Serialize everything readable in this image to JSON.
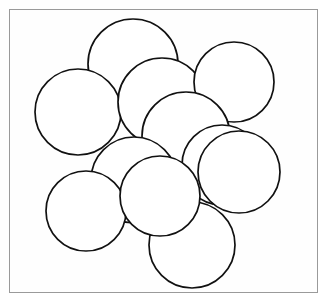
{
  "figure": {
    "kind": "circle-packing-diagram",
    "frame": {
      "x": 9,
      "y": 9,
      "width": 309,
      "height": 284,
      "stroke_color": "#9a9a9a",
      "fill_color": "#fefefe"
    },
    "canvas": {
      "width": 333,
      "height": 300,
      "background_color": "#ffffff"
    },
    "style": {
      "circle_fill": "#ffffff",
      "circle_stroke": "#111111",
      "circle_stroke_width": 1.7
    },
    "circle_count": 11,
    "circles": [
      {
        "id": "circle-top-center",
        "label": "1",
        "cx": 133,
        "cy": 64,
        "r": 45
      },
      {
        "id": "circle-left-upper",
        "label": "2",
        "cx": 78,
        "cy": 112,
        "r": 43
      },
      {
        "id": "circle-mid-upper",
        "label": "3",
        "cx": 162,
        "cy": 102,
        "r": 44
      },
      {
        "id": "circle-right-upper",
        "label": "4",
        "cx": 234,
        "cy": 82,
        "r": 40
      },
      {
        "id": "circle-center-large",
        "label": "5",
        "cx": 186,
        "cy": 136,
        "r": 44
      },
      {
        "id": "circle-center-left",
        "label": "6",
        "cx": 134,
        "cy": 180,
        "r": 43
      },
      {
        "id": "circle-right-inner",
        "label": "7",
        "cx": 222,
        "cy": 165,
        "r": 40
      },
      {
        "id": "circle-right-outer",
        "label": "8",
        "cx": 239,
        "cy": 172,
        "r": 41
      },
      {
        "id": "circle-bottom-left",
        "label": "9",
        "cx": 86,
        "cy": 211,
        "r": 40
      },
      {
        "id": "circle-bottom-center",
        "label": "10",
        "cx": 192,
        "cy": 245,
        "r": 43
      },
      {
        "id": "circle-lower-mid",
        "label": "11",
        "cx": 160,
        "cy": 196,
        "r": 40
      }
    ]
  },
  "chart_data": {
    "type": "scatter",
    "xlabel": "",
    "ylabel": "",
    "xlim": [
      9,
      318
    ],
    "ylim": [
      9,
      293
    ],
    "grid": false,
    "legend": "none",
    "annotations": [],
    "series": [
      {
        "name": "circles",
        "x": [
          133,
          78,
          162,
          234,
          186,
          134,
          222,
          239,
          86,
          192,
          160
        ],
        "y": [
          64,
          112,
          102,
          82,
          136,
          180,
          165,
          172,
          211,
          245,
          196
        ],
        "radii": [
          45,
          43,
          44,
          40,
          44,
          43,
          40,
          41,
          40,
          43,
          40
        ]
      }
    ]
  }
}
